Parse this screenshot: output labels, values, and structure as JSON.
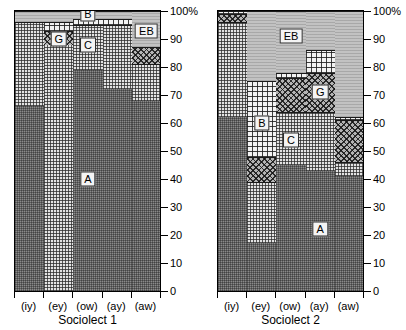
{
  "chart_data": {
    "type": "bar",
    "subtype": "100% stacked bar chart, two panels",
    "title": "",
    "xlabel": "",
    "ylabel": "",
    "ylim": [
      0,
      100
    ],
    "y_unit": "%",
    "grid": false,
    "legend": "inline segment labels",
    "y_ticks": [
      "0",
      "10",
      "20",
      "30",
      "40",
      "50",
      "60",
      "70",
      "80",
      "90",
      "100%"
    ],
    "y_tick_values": [
      0,
      10,
      20,
      30,
      40,
      50,
      60,
      70,
      80,
      90,
      100
    ],
    "categories": [
      "(iy)",
      "(ey)",
      "(ow)",
      "(ay)",
      "(aw)"
    ],
    "segment_keys": [
      "A",
      "C",
      "G",
      "B",
      "EB"
    ],
    "panels": [
      {
        "name": "Sociolect 1",
        "series": [
          {
            "name": "A",
            "values": [
              66,
              0,
              79,
              72,
              68
            ]
          },
          {
            "name": "C",
            "values": [
              30,
              88,
              16,
              23,
              13
            ]
          },
          {
            "name": "G",
            "values": [
              0,
              5,
              0,
              0,
              6
            ]
          },
          {
            "name": "B",
            "values": [
              0,
              3,
              2,
              2,
              0
            ]
          },
          {
            "name": "EB",
            "values": [
              4,
              4,
              3,
              3,
              13
            ]
          }
        ],
        "labels": [
          {
            "key": "A",
            "text": "A",
            "category": "(ow)",
            "at": 40
          },
          {
            "key": "C",
            "text": "C",
            "category": "(ow)",
            "at": 88
          },
          {
            "key": "G",
            "text": "G",
            "category": "(ey)",
            "at": 90
          },
          {
            "key": "B",
            "text": "B",
            "category": "(ow)",
            "at": 99
          },
          {
            "key": "EB",
            "text": "EB",
            "category": "(aw)",
            "at": 93
          }
        ]
      },
      {
        "name": "Sociolect 2",
        "series": [
          {
            "name": "A",
            "values": [
              62,
              17,
              45,
              43,
              41
            ]
          },
          {
            "name": "C",
            "values": [
              34,
              22,
              19,
              21,
              5
            ]
          },
          {
            "name": "G",
            "values": [
              3,
              9,
              12,
              14,
              15
            ]
          },
          {
            "name": "B",
            "values": [
              1,
              27,
              2,
              8,
              1
            ]
          },
          {
            "name": "EB",
            "values": [
              0,
              25,
              22,
              14,
              38
            ]
          }
        ],
        "labels": [
          {
            "key": "A",
            "text": "A",
            "category": "(ay)",
            "at": 22
          },
          {
            "key": "C",
            "text": "C",
            "category": "(ow)",
            "at": 54
          },
          {
            "key": "G",
            "text": "G",
            "category": "(ay)",
            "at": 71
          },
          {
            "key": "B",
            "text": "B",
            "category": "(ey)",
            "at": 60
          },
          {
            "key": "EB",
            "text": "EB",
            "category": "(ow)",
            "at": 91
          }
        ]
      }
    ]
  },
  "colors": {
    "A": "#8a8a8a",
    "C": "#e3e3e3",
    "G": "#b4b4b4",
    "B": "#f2f2f2",
    "EB": "#c2c2c2",
    "axis": "#000000",
    "background": "#ffffff"
  }
}
